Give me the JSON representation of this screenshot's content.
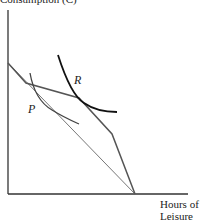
{
  "axis_labels": {
    "y": "Consumption (C)",
    "x_line1": "Hours of",
    "x_line2": "Leisure"
  },
  "curve_labels": {
    "R": "R",
    "P": "P"
  },
  "colors": {
    "axis": "#333333",
    "budget_thin": "#666666",
    "budget_kinked": "#555555",
    "indifference_R": "#111111",
    "indifference_P": "#444444"
  }
}
